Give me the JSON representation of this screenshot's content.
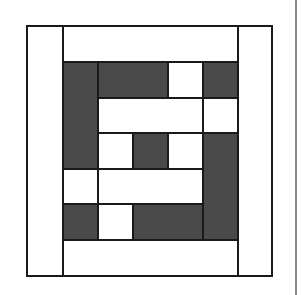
{
  "figure": {
    "colors": {
      "dark": "#4a4a4a",
      "light": "#ffffff",
      "line": "#1a1a1a",
      "side_rule": "#8a8a8a"
    },
    "grid": {
      "x_lines": [
        27,
        63,
        98,
        133,
        168,
        203,
        238,
        272
      ],
      "y_lines": [
        26,
        62,
        98,
        133,
        169,
        204,
        240,
        276
      ]
    },
    "patches": [
      {
        "id": "left-border",
        "col": 0,
        "row": 0,
        "colspan": 1,
        "rowspan": 7,
        "tone": "light"
      },
      {
        "id": "right-border",
        "col": 6,
        "row": 0,
        "colspan": 1,
        "rowspan": 7,
        "tone": "light"
      },
      {
        "id": "top-border",
        "col": 1,
        "row": 0,
        "colspan": 5,
        "rowspan": 1,
        "tone": "light"
      },
      {
        "id": "bottom-border",
        "col": 1,
        "row": 6,
        "colspan": 5,
        "rowspan": 1,
        "tone": "light"
      },
      {
        "id": "left-dark-bar",
        "col": 1,
        "row": 1,
        "colspan": 1,
        "rowspan": 3,
        "tone": "dark"
      },
      {
        "id": "top-dark-bar",
        "col": 2,
        "row": 1,
        "colspan": 2,
        "rowspan": 1,
        "tone": "dark"
      },
      {
        "id": "top-light-square",
        "col": 4,
        "row": 1,
        "colspan": 1,
        "rowspan": 1,
        "tone": "light"
      },
      {
        "id": "top-right-dark-square",
        "col": 5,
        "row": 1,
        "colspan": 1,
        "rowspan": 1,
        "tone": "dark"
      },
      {
        "id": "upper-light-bar",
        "col": 2,
        "row": 2,
        "colspan": 3,
        "rowspan": 1,
        "tone": "light"
      },
      {
        "id": "right-light-square",
        "col": 5,
        "row": 2,
        "colspan": 1,
        "rowspan": 1,
        "tone": "light"
      },
      {
        "id": "center-left-light",
        "col": 2,
        "row": 3,
        "colspan": 1,
        "rowspan": 1,
        "tone": "light"
      },
      {
        "id": "center-dark",
        "col": 3,
        "row": 3,
        "colspan": 1,
        "rowspan": 1,
        "tone": "dark"
      },
      {
        "id": "center-right-light",
        "col": 4,
        "row": 3,
        "colspan": 1,
        "rowspan": 1,
        "tone": "light"
      },
      {
        "id": "right-dark-bar",
        "col": 5,
        "row": 3,
        "colspan": 1,
        "rowspan": 3,
        "tone": "dark"
      },
      {
        "id": "left-light-square",
        "col": 1,
        "row": 4,
        "colspan": 1,
        "rowspan": 1,
        "tone": "light"
      },
      {
        "id": "lower-light-bar",
        "col": 2,
        "row": 4,
        "colspan": 3,
        "rowspan": 1,
        "tone": "light"
      },
      {
        "id": "bottom-left-dark-square",
        "col": 1,
        "row": 5,
        "colspan": 1,
        "rowspan": 1,
        "tone": "dark"
      },
      {
        "id": "bottom-light-square",
        "col": 2,
        "row": 5,
        "colspan": 1,
        "rowspan": 1,
        "tone": "light"
      },
      {
        "id": "bottom-dark-bar",
        "col": 3,
        "row": 5,
        "colspan": 2,
        "rowspan": 1,
        "tone": "dark"
      }
    ]
  }
}
